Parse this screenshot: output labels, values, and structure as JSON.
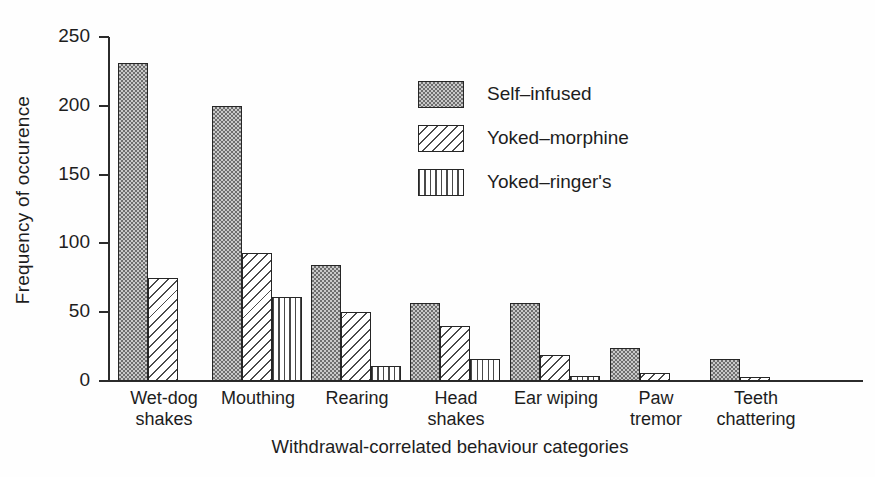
{
  "chart_data": {
    "type": "bar",
    "title": "",
    "xlabel": "Withdrawal-correlated behaviour categories",
    "ylabel": "Frequency of occurence",
    "ylim": [
      0,
      250
    ],
    "yticks": [
      0,
      50,
      100,
      150,
      200,
      250
    ],
    "grid": false,
    "legend_position": "upper-center-right",
    "categories": [
      "Wet-dog shakes",
      "Mouthing",
      "Rearing",
      "Head shakes",
      "Ear wiping",
      "Paw tremor",
      "Teeth chattering"
    ],
    "category_lines": [
      [
        "Wet-dog",
        "shakes"
      ],
      [
        "Mouthing",
        ""
      ],
      [
        "Rearing",
        ""
      ],
      [
        "Head",
        "shakes"
      ],
      [
        "Ear wiping",
        ""
      ],
      [
        "Paw",
        "tremor"
      ],
      [
        "Teeth",
        "chattering"
      ]
    ],
    "series": [
      {
        "name": "Self–infused",
        "pattern": "dots",
        "values": [
          231,
          200,
          84,
          57,
          57,
          24,
          16
        ]
      },
      {
        "name": "Yoked–morphine",
        "pattern": "diagonal-hatch",
        "values": [
          75,
          93,
          50,
          40,
          19,
          6,
          3
        ]
      },
      {
        "name": "Yoked–ringer's",
        "pattern": "vertical-lines",
        "values": [
          0,
          61,
          11,
          16,
          4,
          0,
          0
        ]
      }
    ]
  },
  "axis": {
    "y_title": "Frequency of occurence",
    "x_title": "Withdrawal-correlated behaviour categories",
    "y_tick_labels": [
      "250",
      "200",
      "150",
      "100",
      "50",
      "0"
    ]
  },
  "legend": {
    "items": [
      {
        "label": "Self–infused",
        "pattern": "dots"
      },
      {
        "label": "Yoked–morphine",
        "pattern": "diagonal-hatch"
      },
      {
        "label": "Yoked–ringer's",
        "pattern": "vertical-lines"
      }
    ]
  },
  "colors": {
    "ink": "#1d1d1d",
    "axis": "#2b2b2b",
    "bar_outline": "#262626",
    "dots_base": "#c9c9c9",
    "dots_ink": "#6e6e6e",
    "hatch_ink": "#4a4a4a",
    "background": "#fefefe"
  }
}
